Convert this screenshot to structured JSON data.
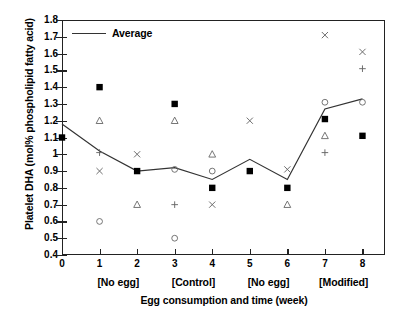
{
  "chart_data": {
    "type": "scatter",
    "title": "",
    "xlabel": "Egg consumption and time (week)",
    "ylabel": "Platelet DHA (mol% phospholipid fatty acid)",
    "xlim": [
      0,
      8.6
    ],
    "ylim": [
      0.4,
      1.8
    ],
    "x_ticks": [
      "0",
      "1",
      "2",
      "3",
      "4",
      "5",
      "6",
      "7",
      "8"
    ],
    "x_tick_values": [
      0,
      1,
      2,
      3,
      4,
      5,
      6,
      7,
      8
    ],
    "y_ticks": [
      "0.4",
      "0.5",
      "0.6",
      "0.7",
      "0.8",
      "0.9",
      "1",
      "1.1",
      "1.2",
      "1.3",
      "1.4",
      "1.5",
      "1.6",
      "1.7",
      "1.8"
    ],
    "y_tick_values": [
      0.4,
      0.5,
      0.6,
      0.7,
      0.8,
      0.9,
      1.0,
      1.1,
      1.2,
      1.3,
      1.4,
      1.5,
      1.6,
      1.7,
      1.8
    ],
    "grid": false,
    "legend_position": "top-left",
    "group_annotations": [
      {
        "label": "[No egg]",
        "x": 1.5
      },
      {
        "label": "[Control]",
        "x": 3.5
      },
      {
        "label": "[No egg]",
        "x": 5.5
      },
      {
        "label": "[Modified]",
        "x": 7.5
      }
    ],
    "series": [
      {
        "name": "Average",
        "marker": "none",
        "line": true,
        "color": "#333333",
        "x": [
          0,
          1,
          2,
          3,
          4,
          5,
          6,
          7,
          8
        ],
        "values": [
          1.18,
          1.02,
          0.9,
          0.92,
          0.85,
          0.97,
          0.85,
          1.27,
          1.33
        ]
      },
      {
        "name": "Subject A",
        "marker": "filled-square",
        "line": false,
        "color": "#000000",
        "x": [
          0,
          1,
          2,
          3,
          4,
          5,
          6,
          7,
          8
        ],
        "values": [
          1.1,
          1.4,
          0.9,
          1.3,
          0.8,
          0.9,
          0.8,
          1.21,
          1.11
        ]
      },
      {
        "name": "Subject B",
        "marker": "open-triangle",
        "line": false,
        "color": "#666666",
        "x": [
          1,
          2,
          3,
          4,
          6,
          7
        ],
        "values": [
          1.2,
          0.7,
          1.2,
          1.0,
          0.7,
          1.11
        ]
      },
      {
        "name": "Subject C",
        "marker": "plus",
        "line": false,
        "color": "#666666",
        "x": [
          1,
          3,
          7,
          8
        ],
        "values": [
          1.01,
          0.7,
          1.01,
          1.51
        ]
      },
      {
        "name": "Subject D",
        "marker": "cross",
        "line": false,
        "color": "#666666",
        "x": [
          1,
          2,
          4,
          5,
          6,
          7,
          8
        ],
        "values": [
          0.9,
          1.0,
          0.7,
          1.2,
          0.91,
          1.71,
          1.61
        ]
      },
      {
        "name": "Subject E",
        "marker": "open-circle",
        "line": false,
        "color": "#666666",
        "x": [
          1,
          3,
          3,
          4,
          7,
          8
        ],
        "values": [
          0.6,
          0.91,
          0.5,
          0.9,
          1.31,
          1.31
        ]
      }
    ]
  },
  "legend": {
    "entries": [
      {
        "label": "Average",
        "style": "line"
      }
    ]
  },
  "axes": {
    "y_title": "Platelet DHA (mol% phospholipid fatty acid)",
    "x_title": "Egg consumption and time (week)"
  }
}
